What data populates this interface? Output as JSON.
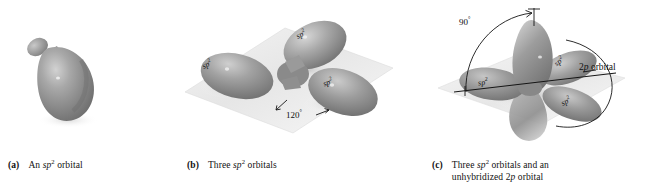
{
  "figure": {
    "background_color": "#ffffff",
    "orbital_color": "#8d8d8d",
    "plane_color": "#e9e9e9"
  },
  "panels": [
    {
      "key": "a",
      "tag": "(a)",
      "caption_lines": [
        "An sp2 orbital"
      ],
      "caption_line1_pre": "An ",
      "caption_line1_sp": "sp",
      "caption_line1_sup": "2",
      "caption_line1_post": " orbital",
      "caption_line2": "",
      "has_plane": false,
      "labels": [],
      "annotations": []
    },
    {
      "key": "b",
      "tag": "(b)",
      "caption_lines": [
        "Three sp2 orbitals"
      ],
      "caption_line1_pre": "Three ",
      "caption_line1_sp": "sp",
      "caption_line1_sup": "2",
      "caption_line1_post": " orbitals",
      "caption_line2": "",
      "has_plane": true,
      "labels": [
        {
          "name": "sp2-label-left",
          "text": "sp",
          "sup": "2"
        },
        {
          "name": "sp2-label-top",
          "text": "sp",
          "sup": "2"
        },
        {
          "name": "sp2-label-right",
          "text": "sp",
          "sup": "2"
        }
      ],
      "annotations": [
        {
          "name": "angle-120",
          "value": "120",
          "unit": "°"
        }
      ]
    },
    {
      "key": "c",
      "tag": "(c)",
      "caption_lines": [
        "Three sp2 orbitals and an",
        "unhybridized 2p orbital"
      ],
      "caption_line1_pre": "Three ",
      "caption_line1_sp": "sp",
      "caption_line1_sup": "2",
      "caption_line1_post": " orbitals and an",
      "caption_line2_pre": "unhybridized 2",
      "caption_line2_it": "p",
      "caption_line2_post": " orbital",
      "has_plane": true,
      "labels": [
        {
          "name": "sp2-label-left",
          "text": "sp",
          "sup": "2"
        },
        {
          "name": "sp2-label-upper-right",
          "text": "sp",
          "sup": "2"
        },
        {
          "name": "sp2-label-lower-right",
          "text": "sp",
          "sup": "2"
        }
      ],
      "annotations": [
        {
          "name": "angle-90",
          "value": "90",
          "unit": "°"
        },
        {
          "name": "p-orbital-callout",
          "pre": "2",
          "it": "p",
          "post": " orbital"
        }
      ]
    }
  ]
}
